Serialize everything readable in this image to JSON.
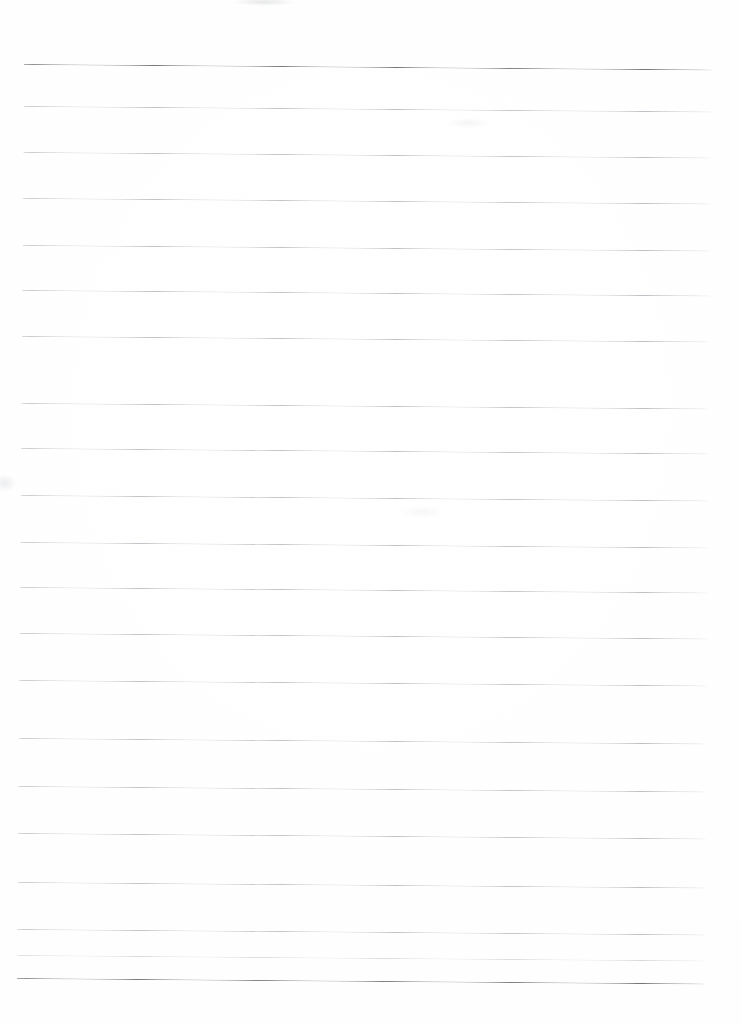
{
  "document": {
    "kind": "blank-lined-paper-scan",
    "page_width": 740,
    "page_height": 1023,
    "background_color": "#ffffff",
    "paper_tone_color": "#fefefe",
    "text_content": "",
    "handwriting_present": false,
    "page_number_label": "",
    "header_text": "",
    "footer_text": "",
    "margin_rule_visible": false,
    "margin_rule_color": "#c9a2a2"
  },
  "ruling": {
    "line_count": 21,
    "line_spacing_px": 45.7,
    "first_line_y": 64,
    "last_line_y": 978,
    "line_start_x": 24,
    "line_end_x": 712,
    "line_length_px": 688,
    "skew_degrees": 0.46,
    "heavy_line_color": "#6f7276",
    "light_line_color": "#bcc0c4",
    "heavy_line_width_px": 1.4,
    "light_line_width_px": 1.0,
    "heavy_line_indices": [
      0,
      20
    ],
    "lines": [
      {
        "index": 0,
        "y": 64,
        "weight": "heavy",
        "color": "#6f7276"
      },
      {
        "index": 1,
        "y": 106,
        "weight": "light",
        "color": "#bcc0c4"
      },
      {
        "index": 2,
        "y": 152,
        "weight": "light",
        "color": "#bcc0c4"
      },
      {
        "index": 3,
        "y": 198,
        "weight": "light",
        "color": "#bcc0c4"
      },
      {
        "index": 4,
        "y": 245,
        "weight": "light",
        "color": "#bcc0c4"
      },
      {
        "index": 5,
        "y": 290,
        "weight": "light",
        "color": "#bcc0c4"
      },
      {
        "index": 6,
        "y": 336,
        "weight": "light",
        "color": "#bcc0c4"
      },
      {
        "index": 7,
        "y": 403,
        "weight": "light",
        "color": "#bcc0c4"
      },
      {
        "index": 8,
        "y": 448,
        "weight": "light",
        "color": "#bcc0c4"
      },
      {
        "index": 9,
        "y": 495,
        "weight": "light",
        "color": "#bcc0c4"
      },
      {
        "index": 10,
        "y": 542,
        "weight": "light",
        "color": "#bcc0c4"
      },
      {
        "index": 11,
        "y": 587,
        "weight": "light",
        "color": "#bcc0c4"
      },
      {
        "index": 12,
        "y": 633,
        "weight": "light",
        "color": "#bcc0c4"
      },
      {
        "index": 13,
        "y": 680,
        "weight": "light",
        "color": "#bcc0c4"
      },
      {
        "index": 14,
        "y": 738,
        "weight": "light",
        "color": "#bcc0c4"
      },
      {
        "index": 15,
        "y": 786,
        "weight": "light",
        "color": "#bcc0c4"
      },
      {
        "index": 16,
        "y": 833,
        "weight": "light",
        "color": "#bcc0c4"
      },
      {
        "index": 17,
        "y": 882,
        "weight": "light",
        "color": "#bcc0c4"
      },
      {
        "index": 18,
        "y": 929,
        "weight": "light",
        "color": "#bcc0c4"
      },
      {
        "index": 19,
        "y": 955,
        "weight": "light",
        "color": "#d6d9dc"
      },
      {
        "index": 20,
        "y": 978,
        "weight": "heavy",
        "color": "#6f7276"
      }
    ]
  },
  "artifacts": [
    {
      "name": "smudge-top",
      "x": 232,
      "y": -2,
      "width": 64,
      "height": 8,
      "opacity": 0.26
    },
    {
      "name": "smudge-left",
      "x": -6,
      "y": 474,
      "width": 22,
      "height": 18,
      "opacity": 0.22
    },
    {
      "name": "smudge-mid",
      "x": 448,
      "y": 118,
      "width": 40,
      "height": 10,
      "opacity": 0.14
    },
    {
      "name": "smudge-mid2",
      "x": 400,
      "y": 506,
      "width": 46,
      "height": 12,
      "opacity": 0.12
    }
  ],
  "accessibility": {
    "description": "Scanned image of a blank sheet of ruled writing paper. Twenty-one faint horizontal lines run across the page; the topmost and bottommost rules are darker than the rest. No handwriting, headings, or page numbers are present."
  }
}
